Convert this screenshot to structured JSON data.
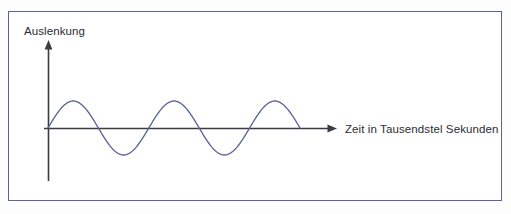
{
  "figure": {
    "title_visible": false,
    "background_color": "#ffffff",
    "frame_color": "#5b62a0"
  },
  "axes": {
    "y_axis": {
      "label": "Auslenkung",
      "label_name": "y-axis-label",
      "color": "#3b3b44",
      "has_arrow": true,
      "arrow_direction": "up"
    },
    "x_axis": {
      "label": "Zeit in Tausendstel Sekunden",
      "label_name": "x-axis-label",
      "color": "#3b3b44",
      "has_arrow": true,
      "arrow_direction": "right"
    }
  },
  "chart_data": {
    "type": "line",
    "title": "",
    "xlabel": "Zeit in Tausendstel Sekunden",
    "ylabel": "Auslenkung",
    "grid": false,
    "legend": "none",
    "axis_ticks": [],
    "tick_labels": [],
    "series": [
      {
        "name": "Schwingung",
        "color": "#5a6699",
        "waveform": "sine",
        "amplitude": 1.0,
        "period": 2.0,
        "phase": 0.0,
        "cycles": 2.5,
        "x": [
          0.0,
          0.1,
          0.2,
          0.3,
          0.4,
          0.5,
          0.6,
          0.7,
          0.8,
          0.9,
          1.0,
          1.1,
          1.2,
          1.3,
          1.4,
          1.5,
          1.6,
          1.7,
          1.8,
          1.9,
          2.0,
          2.1,
          2.2,
          2.3,
          2.4,
          2.5,
          2.6,
          2.7,
          2.8,
          2.9,
          3.0,
          3.1,
          3.2,
          3.3,
          3.4,
          3.5,
          3.6,
          3.7,
          3.8,
          3.9,
          4.0,
          4.1,
          4.2,
          4.3,
          4.4,
          4.5,
          4.6,
          4.7,
          4.8,
          4.9,
          5.0
        ],
        "y": [
          0.0,
          0.309,
          0.588,
          0.809,
          0.951,
          1.0,
          0.951,
          0.809,
          0.588,
          0.309,
          0.0,
          -0.309,
          -0.588,
          -0.809,
          -0.951,
          -1.0,
          -0.951,
          -0.809,
          -0.588,
          -0.309,
          0.0,
          0.309,
          0.588,
          0.809,
          0.951,
          1.0,
          0.951,
          0.809,
          0.588,
          0.309,
          0.0,
          -0.309,
          -0.588,
          -0.809,
          -0.951,
          -1.0,
          -0.951,
          -0.809,
          -0.588,
          -0.309,
          0.0,
          0.309,
          0.588,
          0.809,
          0.951,
          1.0,
          0.951,
          0.809,
          0.588,
          0.309,
          0.0
        ]
      }
    ],
    "xlim": [
      0.0,
      5.0
    ],
    "ylim": [
      -1.0,
      1.0
    ]
  },
  "geometry": {
    "origin_px": {
      "x": 48,
      "y": 128
    },
    "x_axis_end_px": 336,
    "y_axis_top_px": 42,
    "y_axis_bottom_px": 181,
    "amplitude_px": 27,
    "half_period_px": 50,
    "wave_start_px": 48,
    "wave_end_px": 300
  }
}
